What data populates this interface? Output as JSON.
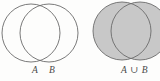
{
  "figure": {
    "background_color": "#fdfdfc",
    "stroke_color": "#6b6b6b",
    "shade_color": "#c8c8c8",
    "width": 160,
    "height": 81
  },
  "diagrams": [
    {
      "id": "unshaded-pair",
      "caption_parts": {
        "set_a": "A",
        "set_b": "B"
      },
      "shaded": false,
      "circles": [
        {
          "name": "circle-a",
          "cx": 31,
          "cy": 33,
          "r": 29,
          "fill": "none"
        },
        {
          "name": "circle-b",
          "cx": 49,
          "cy": 33,
          "r": 29,
          "fill": "none"
        }
      ]
    },
    {
      "id": "union-shaded",
      "caption_parts": {
        "union": "A ∪ B"
      },
      "shaded": true,
      "circles": [
        {
          "name": "circle-a",
          "cx": 122,
          "cy": 31,
          "r": 29,
          "fill": "#c8c8c8"
        },
        {
          "name": "circle-b",
          "cx": 140,
          "cy": 31,
          "r": 29,
          "fill": "#c8c8c8"
        }
      ]
    }
  ]
}
